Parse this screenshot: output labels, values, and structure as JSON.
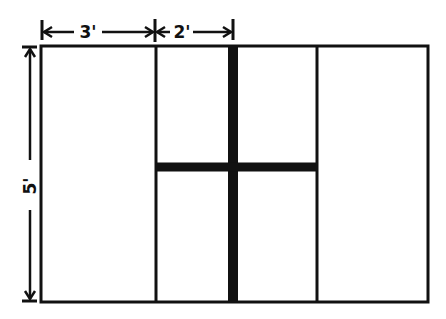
{
  "diagram": {
    "type": "panel-layout-dimension-drawing",
    "dimensions": {
      "top_left_segment": "3'",
      "top_right_segment": "2'",
      "height": "5'"
    },
    "colors": {
      "ink": "#111111",
      "background": "#ffffff"
    }
  }
}
